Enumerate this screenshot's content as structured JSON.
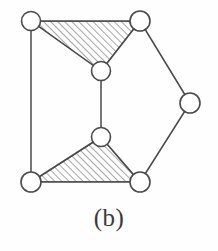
{
  "figure": {
    "caption": "(b)",
    "kind": "planar-graph-with-shaded-faces",
    "canvas": {
      "width": 218,
      "height": 251
    },
    "colors": {
      "background": "#fefefe",
      "stroke": "#4a4a4a",
      "node_fill": "#ffffff",
      "hatch": "#5a5a5a",
      "caption": "#3b3b3b"
    },
    "style": {
      "edge_stroke_width": 1.5,
      "node_stroke_width": 1.6,
      "node_radius": 9.5,
      "hatch_spacing": 5,
      "hatch_angle_deg": 45,
      "hatch_direction": "forward-slash"
    }
  },
  "graph": {
    "node_count": 7,
    "edge_count": 9,
    "nodes": [
      {
        "id": "v1",
        "label": "top-left",
        "cx": 31,
        "cy": 21,
        "r": 9.5
      },
      {
        "id": "v2",
        "label": "top-right",
        "cx": 140,
        "cy": 21,
        "r": 10
      },
      {
        "id": "v3",
        "label": "mid-upper",
        "cx": 101,
        "cy": 71,
        "r": 9.5
      },
      {
        "id": "v4",
        "label": "right",
        "cx": 190,
        "cy": 103,
        "r": 10
      },
      {
        "id": "v5",
        "label": "mid-lower",
        "cx": 101,
        "cy": 137,
        "r": 9.5
      },
      {
        "id": "v6",
        "label": "bottom-left",
        "cx": 31,
        "cy": 182,
        "r": 10
      },
      {
        "id": "v7",
        "label": "bottom-right",
        "cx": 140,
        "cy": 182,
        "r": 10
      }
    ],
    "edges": [
      {
        "id": "e1",
        "from": "v1",
        "to": "v2",
        "note": "top horizontal"
      },
      {
        "id": "e2",
        "from": "v1",
        "to": "v3",
        "note": "upper triangle left side"
      },
      {
        "id": "e3",
        "from": "v2",
        "to": "v3",
        "note": "upper triangle right side"
      },
      {
        "id": "e4",
        "from": "v1",
        "to": "v6",
        "note": "left vertical"
      },
      {
        "id": "e5",
        "from": "v3",
        "to": "v5",
        "note": "middle vertical"
      },
      {
        "id": "e6",
        "from": "v2",
        "to": "v4",
        "note": "upper right diagonal"
      },
      {
        "id": "e7",
        "from": "v4",
        "to": "v7",
        "note": "lower right diagonal"
      },
      {
        "id": "e8",
        "from": "v6",
        "to": "v5",
        "note": "lower triangle left side"
      },
      {
        "id": "e9",
        "from": "v5",
        "to": "v7",
        "note": "lower triangle right side"
      },
      {
        "id": "e10",
        "from": "v6",
        "to": "v7",
        "note": "bottom horizontal"
      }
    ],
    "shaded_faces": [
      {
        "id": "f1",
        "label": "upper-hatched-triangle",
        "vertices": [
          "v1",
          "v2",
          "v3"
        ]
      },
      {
        "id": "f2",
        "label": "lower-hatched-triangle",
        "vertices": [
          "v6",
          "v5",
          "v7"
        ]
      }
    ]
  }
}
